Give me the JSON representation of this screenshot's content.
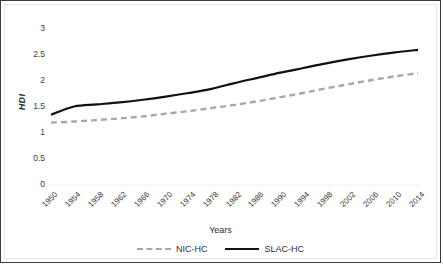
{
  "chart_data": {
    "type": "line",
    "title": "",
    "xlabel": "Years",
    "ylabel": "HDI",
    "ylim": [
      0,
      3
    ],
    "yticks": [
      0,
      0.5,
      1,
      1.5,
      2,
      2.5,
      3
    ],
    "ytick_labels": [
      "0",
      "0.5",
      "1",
      "1.5",
      "2",
      "2.5",
      "3"
    ],
    "grid": false,
    "legend_position": "bottom",
    "categories": [
      "1950",
      "1954",
      "1958",
      "1962",
      "1966",
      "1970",
      "1974",
      "1978",
      "1982",
      "1986",
      "1990",
      "1994",
      "1998",
      "2002",
      "2006",
      "2010",
      "2014"
    ],
    "x": [
      1950,
      1954,
      1958,
      1962,
      1966,
      1970,
      1974,
      1978,
      1982,
      1986,
      1990,
      1994,
      1998,
      2002,
      2006,
      2010,
      2014
    ],
    "series": [
      {
        "name": "NIC-HC",
        "style": "dashed",
        "color": "#a8a8a8",
        "values": [
          1.2,
          1.22,
          1.25,
          1.28,
          1.32,
          1.37,
          1.42,
          1.48,
          1.54,
          1.61,
          1.69,
          1.77,
          1.86,
          1.94,
          2.02,
          2.09,
          2.15
        ]
      },
      {
        "name": "SLAC-HC",
        "style": "solid",
        "color": "#111111",
        "values": [
          1.35,
          1.51,
          1.55,
          1.59,
          1.64,
          1.7,
          1.77,
          1.85,
          1.96,
          2.06,
          2.16,
          2.25,
          2.34,
          2.42,
          2.49,
          2.55,
          2.6
        ]
      }
    ],
    "series_detail_note": "SLAC-HC rises sharply from 1.35 at 1950 to about 1.50 by 1952 then climbs smoothly"
  },
  "legend": {
    "items": [
      {
        "label": "NIC-HC"
      },
      {
        "label": "SLAC-HC"
      }
    ]
  },
  "axes": {
    "x_title": "Years",
    "y_title": "HDI"
  }
}
